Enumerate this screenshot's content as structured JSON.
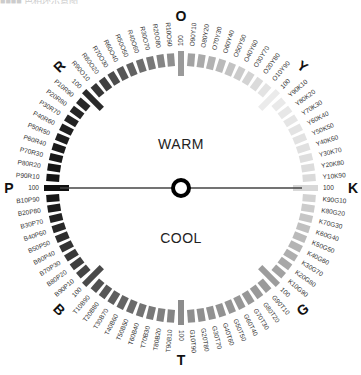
{
  "title": "■■■■ 色相环示意图",
  "center_labels": {
    "warm": "WARM",
    "cool": "COOL"
  },
  "hues": [
    {
      "key": "O",
      "label": "O",
      "angle": -90
    },
    {
      "key": "Y",
      "label": "Y",
      "angle": -45
    },
    {
      "key": "K",
      "label": "K",
      "angle": 0
    },
    {
      "key": "G",
      "label": "G",
      "angle": 45
    },
    {
      "key": "T",
      "label": "T",
      "angle": 90
    },
    {
      "key": "B",
      "label": "B",
      "angle": 135
    },
    {
      "key": "P",
      "label": "P",
      "angle": 180
    },
    {
      "key": "R",
      "label": "R",
      "angle": -135
    }
  ],
  "hue_gray": {
    "O": "#9a9a9a",
    "Y": "#ebebeb",
    "K": "#d8d8d8",
    "G": "#9c9c9c",
    "T": "#8c8c8c",
    "B": "#4a4a4a",
    "P": "#111111",
    "R": "#2a2a2a"
  },
  "segments_per_hue": 10,
  "axis": {
    "from": "P",
    "to": "K",
    "color": "#444444"
  }
}
